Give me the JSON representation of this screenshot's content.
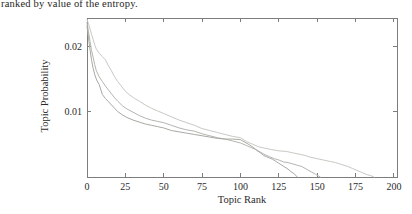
{
  "caption": {
    "text": "ranked by value of the entropy."
  },
  "chart_data": {
    "type": "line",
    "title": "",
    "xlabel": "Topic Rank",
    "ylabel": "Topic Probability",
    "xlim": [
      0,
      202
    ],
    "ylim": [
      0,
      0.0243
    ],
    "xticks": [
      0,
      25,
      50,
      75,
      100,
      125,
      150,
      175,
      200
    ],
    "xtick_labels": [
      "0",
      "25",
      "50",
      "75",
      "100",
      "125",
      "150",
      "175",
      "200"
    ],
    "yticks": [
      0.01,
      0.02
    ],
    "ytick_labels": [
      "0.01",
      "0.02"
    ],
    "grid": false,
    "legend_position": "none",
    "frame_color": "#7d7d7d",
    "text_color": "#2b2b2b",
    "series": [
      {
        "name": "topic-distribution-long-tail",
        "color": "#c7cac3",
        "points": [
          [
            0,
            0.0241
          ],
          [
            1,
            0.0234
          ],
          [
            2,
            0.0226
          ],
          [
            3,
            0.0218
          ],
          [
            4,
            0.021
          ],
          [
            5,
            0.0202
          ],
          [
            6,
            0.0196
          ],
          [
            8,
            0.0189
          ],
          [
            10,
            0.0184
          ],
          [
            12,
            0.0179
          ],
          [
            14,
            0.017
          ],
          [
            16,
            0.0162
          ],
          [
            18,
            0.0153
          ],
          [
            20,
            0.0146
          ],
          [
            22,
            0.014
          ],
          [
            25,
            0.0131
          ],
          [
            28,
            0.0125
          ],
          [
            31,
            0.012
          ],
          [
            34,
            0.0116
          ],
          [
            38,
            0.011
          ],
          [
            42,
            0.0105
          ],
          [
            46,
            0.0101
          ],
          [
            50,
            0.0097
          ],
          [
            55,
            0.0092
          ],
          [
            60,
            0.0087
          ],
          [
            65,
            0.0083
          ],
          [
            70,
            0.0079
          ],
          [
            75,
            0.0074
          ],
          [
            80,
            0.0071
          ],
          [
            85,
            0.0068
          ],
          [
            90,
            0.0065
          ],
          [
            95,
            0.0062
          ],
          [
            100,
            0.006
          ],
          [
            104,
            0.0054
          ],
          [
            108,
            0.005
          ],
          [
            112,
            0.0046
          ],
          [
            116,
            0.0044
          ],
          [
            120,
            0.0042
          ],
          [
            125,
            0.004
          ],
          [
            130,
            0.0039
          ],
          [
            134,
            0.0037
          ],
          [
            138,
            0.0035
          ],
          [
            142,
            0.0033
          ],
          [
            146,
            0.003
          ],
          [
            150,
            0.0028
          ],
          [
            154,
            0.0026
          ],
          [
            158,
            0.0024
          ],
          [
            162,
            0.0022
          ],
          [
            166,
            0.0019
          ],
          [
            170,
            0.0016
          ],
          [
            173,
            0.0013
          ],
          [
            176,
            0.001
          ],
          [
            179,
            0.0007
          ],
          [
            182,
            0.0004
          ],
          [
            185,
            0.0002
          ],
          [
            187,
            0.0
          ]
        ]
      },
      {
        "name": "topic-distribution-medium-tail",
        "color": "#b3b6af",
        "points": [
          [
            0,
            0.0236
          ],
          [
            1,
            0.0222
          ],
          [
            2,
            0.0207
          ],
          [
            3,
            0.0193
          ],
          [
            4,
            0.0183
          ],
          [
            5,
            0.0172
          ],
          [
            6,
            0.0163
          ],
          [
            8,
            0.0153
          ],
          [
            10,
            0.0146
          ],
          [
            12,
            0.0139
          ],
          [
            14,
            0.0133
          ],
          [
            16,
            0.0127
          ],
          [
            18,
            0.0121
          ],
          [
            20,
            0.0116
          ],
          [
            23,
            0.0109
          ],
          [
            26,
            0.0104
          ],
          [
            30,
            0.0099
          ],
          [
            34,
            0.0094
          ],
          [
            38,
            0.009
          ],
          [
            42,
            0.0087
          ],
          [
            46,
            0.0085
          ],
          [
            50,
            0.0083
          ],
          [
            55,
            0.0079
          ],
          [
            60,
            0.0075
          ],
          [
            65,
            0.0072
          ],
          [
            70,
            0.007
          ],
          [
            75,
            0.0066
          ],
          [
            80,
            0.0063
          ],
          [
            85,
            0.006
          ],
          [
            90,
            0.0058
          ],
          [
            95,
            0.0055
          ],
          [
            100,
            0.0052
          ],
          [
            104,
            0.0048
          ],
          [
            107,
            0.0045
          ],
          [
            110,
            0.0042
          ],
          [
            113,
            0.0038
          ],
          [
            116,
            0.0034
          ],
          [
            119,
            0.0031
          ],
          [
            122,
            0.0028
          ],
          [
            125,
            0.0026
          ],
          [
            128,
            0.0023
          ],
          [
            131,
            0.0022
          ],
          [
            134,
            0.002
          ],
          [
            137,
            0.0018
          ],
          [
            140,
            0.0016
          ],
          [
            143,
            0.0012
          ],
          [
            146,
            0.0008
          ],
          [
            149,
            0.0004
          ],
          [
            152,
            0.0
          ]
        ]
      },
      {
        "name": "topic-distribution-short-tail",
        "color": "#a7aaa3",
        "points": [
          [
            0,
            0.0231
          ],
          [
            1,
            0.0212
          ],
          [
            2,
            0.0194
          ],
          [
            3,
            0.0178
          ],
          [
            4,
            0.0166
          ],
          [
            5,
            0.0157
          ],
          [
            6,
            0.015
          ],
          [
            7,
            0.0145
          ],
          [
            8,
            0.0141
          ],
          [
            10,
            0.0126
          ],
          [
            12,
            0.012
          ],
          [
            14,
            0.0115
          ],
          [
            16,
            0.011
          ],
          [
            18,
            0.0105
          ],
          [
            20,
            0.01
          ],
          [
            23,
            0.0095
          ],
          [
            26,
            0.0091
          ],
          [
            30,
            0.0087
          ],
          [
            34,
            0.0084
          ],
          [
            38,
            0.0081
          ],
          [
            42,
            0.0079
          ],
          [
            46,
            0.0077
          ],
          [
            50,
            0.0075
          ],
          [
            55,
            0.0071
          ],
          [
            60,
            0.0069
          ],
          [
            65,
            0.0067
          ],
          [
            70,
            0.0065
          ],
          [
            75,
            0.0063
          ],
          [
            80,
            0.0061
          ],
          [
            85,
            0.0059
          ],
          [
            90,
            0.0058
          ],
          [
            95,
            0.0058
          ],
          [
            100,
            0.0057
          ],
          [
            103,
            0.0053
          ],
          [
            106,
            0.0049
          ],
          [
            109,
            0.0044
          ],
          [
            111,
            0.004
          ],
          [
            113,
            0.0037
          ],
          [
            115,
            0.0033
          ],
          [
            117,
            0.0031
          ],
          [
            119,
            0.0029
          ],
          [
            121,
            0.0027
          ],
          [
            123,
            0.0024
          ],
          [
            125,
            0.0021
          ],
          [
            127,
            0.0018
          ],
          [
            129,
            0.0015
          ],
          [
            131,
            0.0012
          ],
          [
            133,
            0.0008
          ],
          [
            135,
            0.0005
          ],
          [
            137,
            0.0
          ]
        ]
      }
    ]
  }
}
